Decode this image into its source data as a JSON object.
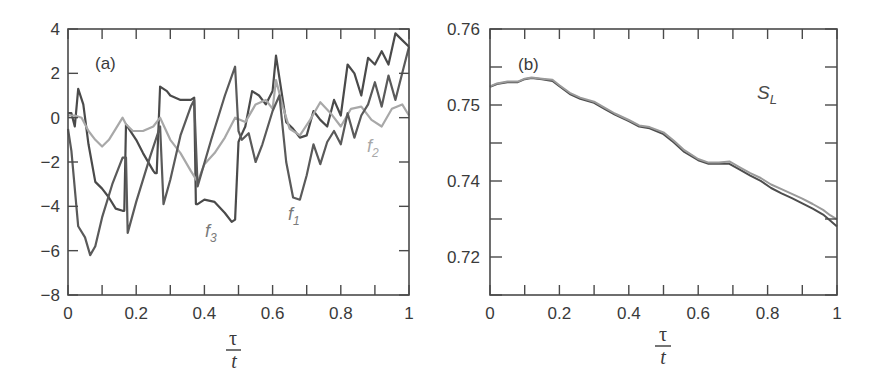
{
  "chart_data": [
    {
      "panel": "(a)",
      "type": "line",
      "xlabel": {
        "numerator": "τ",
        "denominator": "t"
      },
      "ylabel": "",
      "xlim": [
        0,
        1
      ],
      "ylim": [
        -8,
        4
      ],
      "xticks": [
        0,
        0.1,
        0.2,
        0.3,
        0.4,
        0.5,
        0.6,
        0.7,
        0.8,
        0.9,
        1
      ],
      "xtick_labels": [
        "0",
        "0.2",
        "0.4",
        "0.6",
        "0.8",
        "1"
      ],
      "yticks": [
        4,
        2,
        0,
        -2,
        -4,
        -6,
        -8
      ],
      "ytick_labels": [
        "4",
        "2",
        "0",
        "−2",
        "−4",
        "−6",
        "−8"
      ],
      "grid": false,
      "legend": "inline labels",
      "series": [
        {
          "name": "f1",
          "color": "#4a4a4a",
          "label_pos": [
            0.65,
            -4.7
          ],
          "x": [
            0,
            0.01,
            0.02,
            0.03,
            0.045,
            0.06,
            0.08,
            0.1,
            0.12,
            0.14,
            0.16,
            0.165,
            0.17,
            0.2,
            0.22,
            0.25,
            0.255,
            0.26,
            0.27,
            0.29,
            0.3,
            0.33,
            0.36,
            0.37,
            0.375,
            0.38,
            0.4,
            0.43,
            0.46,
            0.48,
            0.49,
            0.5,
            0.505,
            0.52,
            0.54,
            0.56,
            0.58,
            0.6,
            0.61,
            0.62,
            0.64,
            0.66,
            0.68,
            0.7,
            0.72,
            0.74,
            0.76,
            0.78,
            0.8,
            0.82,
            0.84,
            0.86,
            0.88,
            0.9,
            0.92,
            0.94,
            0.96,
            0.98,
            1
          ],
          "y": [
            0.2,
            0.2,
            -0.4,
            1.3,
            0.6,
            -1.2,
            -2.9,
            -3.2,
            -3.6,
            -4.1,
            -4.2,
            -4.2,
            -0.3,
            -1.0,
            -1.6,
            -2.4,
            -2.5,
            -2.5,
            1.4,
            1.2,
            1.0,
            0.8,
            0.8,
            0.9,
            -3.9,
            -3.9,
            -3.7,
            -3.8,
            -4.3,
            -4.7,
            -4.6,
            -1.1,
            -0.9,
            -0.4,
            1.2,
            1.0,
            0.6,
            1.2,
            2.8,
            1.8,
            -0.2,
            -0.5,
            -0.9,
            -0.8,
            0.3,
            -0.1,
            -0.4,
            0.8,
            0.1,
            2.4,
            2.0,
            1.0,
            2.7,
            2.4,
            3.0,
            2.4,
            3.8,
            3.5,
            3.2
          ]
        },
        {
          "name": "f2",
          "color": "#a8a8a8",
          "label_pos": [
            0.91,
            -1.6
          ],
          "x": [
            0,
            0.02,
            0.04,
            0.06,
            0.08,
            0.1,
            0.12,
            0.14,
            0.16,
            0.17,
            0.19,
            0.22,
            0.25,
            0.27,
            0.3,
            0.33,
            0.36,
            0.38,
            0.4,
            0.43,
            0.46,
            0.49,
            0.52,
            0.55,
            0.58,
            0.6,
            0.61,
            0.63,
            0.65,
            0.68,
            0.71,
            0.74,
            0.77,
            0.8,
            0.83,
            0.86,
            0.89,
            0.92,
            0.95,
            0.98,
            1
          ],
          "y": [
            0.1,
            0.1,
            0.0,
            -0.6,
            -1.0,
            -1.3,
            -1.0,
            -0.5,
            0.0,
            -0.3,
            -0.6,
            -0.6,
            -0.4,
            0.0,
            -1.0,
            -1.6,
            -2.4,
            -2.9,
            -2.1,
            -1.6,
            -0.9,
            0.0,
            -0.2,
            0.6,
            0.8,
            0.4,
            1.7,
            0.5,
            -0.5,
            -0.8,
            -0.1,
            0.7,
            0.2,
            -0.4,
            0.4,
            0.5,
            -0.1,
            -0.4,
            0.4,
            0.6,
            0.1
          ]
        },
        {
          "name": "f3",
          "color": "#5a5a5a",
          "label_pos": [
            0.41,
            -5.2
          ],
          "x": [
            0,
            0.01,
            0.03,
            0.05,
            0.065,
            0.08,
            0.1,
            0.13,
            0.16,
            0.17,
            0.175,
            0.2,
            0.24,
            0.27,
            0.28,
            0.3,
            0.33,
            0.36,
            0.37,
            0.38,
            0.42,
            0.46,
            0.49,
            0.5,
            0.51,
            0.53,
            0.55,
            0.57,
            0.6,
            0.62,
            0.64,
            0.66,
            0.68,
            0.7,
            0.72,
            0.74,
            0.76,
            0.78,
            0.8,
            0.82,
            0.84,
            0.86,
            0.88,
            0.9,
            0.92,
            0.94,
            0.96,
            0.98,
            1
          ],
          "y": [
            -0.5,
            -1.5,
            -4.9,
            -5.4,
            -6.2,
            -5.8,
            -4.5,
            -3.0,
            -1.8,
            -1.8,
            -5.2,
            -3.8,
            -1.8,
            -0.4,
            -3.9,
            -2.8,
            -0.8,
            0.5,
            0.8,
            -3.1,
            -1.0,
            1.0,
            2.3,
            -0.6,
            -1.0,
            -0.7,
            -2.0,
            -1.2,
            0.3,
            1.0,
            -2.0,
            -3.6,
            -3.7,
            -2.6,
            -1.2,
            -2.1,
            -1.1,
            -0.6,
            -1.2,
            0.2,
            -0.9,
            0.1,
            0.6,
            1.6,
            0.5,
            1.9,
            0.8,
            2.0,
            3.2
          ]
        }
      ]
    },
    {
      "panel": "(b)",
      "type": "line",
      "annotation": "S_L",
      "xlabel": {
        "numerator": "τ",
        "denominator": "t"
      },
      "ylabel": "",
      "xlim": [
        0,
        1
      ],
      "ylim": [
        0.715,
        0.76
      ],
      "xticks": [
        0,
        0.1,
        0.2,
        0.3,
        0.4,
        0.5,
        0.6,
        0.7,
        0.8,
        0.9,
        1
      ],
      "xtick_labels": [
        "0",
        "0.2",
        "0.4",
        "0.6",
        "0.8",
        "1"
      ],
      "ytick_positions": [
        0,
        1,
        2,
        3,
        4,
        5,
        6,
        7
      ],
      "ytick_labels_at": [
        {
          "pos": 0,
          "label": "0.76"
        },
        {
          "pos": 2,
          "label": "0.75"
        },
        {
          "pos": 4,
          "label": "0.74"
        },
        {
          "pos": 6,
          "label": "0.72"
        }
      ],
      "grid": false,
      "series": [
        {
          "name": "S_L (curve 1)",
          "color": "#4d4d4d",
          "x": [
            0,
            0.02,
            0.05,
            0.08,
            0.1,
            0.12,
            0.15,
            0.18,
            0.2,
            0.23,
            0.26,
            0.3,
            0.33,
            0.36,
            0.4,
            0.43,
            0.46,
            0.5,
            0.53,
            0.56,
            0.6,
            0.63,
            0.66,
            0.69,
            0.72,
            0.75,
            0.78,
            0.81,
            0.84,
            0.87,
            0.9,
            0.93,
            0.96,
            0.98,
            1
          ],
          "y": [
            0.7502,
            0.7507,
            0.751,
            0.751,
            0.7515,
            0.7517,
            0.7515,
            0.7512,
            0.7503,
            0.749,
            0.7482,
            0.7475,
            0.7465,
            0.7455,
            0.7444,
            0.7435,
            0.7432,
            0.7422,
            0.7408,
            0.7392,
            0.7378,
            0.7372,
            0.7372,
            0.7372,
            0.7362,
            0.7352,
            0.7343,
            0.7331,
            0.7322,
            0.7314,
            0.7305,
            0.7296,
            0.7286,
            0.7276,
            0.7266
          ]
        },
        {
          "name": "S_L (curve 2)",
          "color": "#9a9a9a",
          "x": [
            0,
            0.02,
            0.05,
            0.08,
            0.1,
            0.12,
            0.15,
            0.18,
            0.2,
            0.23,
            0.26,
            0.3,
            0.33,
            0.36,
            0.4,
            0.43,
            0.46,
            0.5,
            0.53,
            0.56,
            0.6,
            0.63,
            0.66,
            0.69,
            0.72,
            0.75,
            0.78,
            0.81,
            0.84,
            0.87,
            0.9,
            0.93,
            0.96,
            0.98,
            1
          ],
          "y": [
            0.7503,
            0.7508,
            0.7511,
            0.7511,
            0.7516,
            0.7518,
            0.7516,
            0.7514,
            0.7505,
            0.7492,
            0.7484,
            0.7477,
            0.7467,
            0.7457,
            0.7446,
            0.7437,
            0.7434,
            0.7425,
            0.7411,
            0.7395,
            0.738,
            0.7374,
            0.7374,
            0.7376,
            0.7366,
            0.7356,
            0.7348,
            0.7337,
            0.7329,
            0.7321,
            0.7313,
            0.7304,
            0.7294,
            0.7285,
            0.7278
          ]
        }
      ]
    }
  ],
  "labels": {
    "panel_a": "(a)",
    "panel_b": "(b)",
    "f1": "f",
    "f1_sub": "1",
    "f2": "f",
    "f2_sub": "2",
    "f3": "f",
    "f3_sub": "3",
    "sl": "S",
    "sl_sub": "L",
    "x_num": "τ",
    "x_den": "t"
  }
}
